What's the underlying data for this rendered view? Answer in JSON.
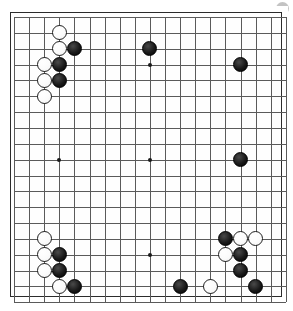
{
  "app": {
    "title": "Go Board Diagram",
    "caption": ""
  },
  "board": {
    "name": "go-board",
    "size": 19,
    "line_color": "#5a5a5a",
    "border_color": "#2b2b2b",
    "background_color": "#fefefe",
    "black_color": "#000000",
    "white_color": "#ffffff",
    "geometry": {
      "origin_x": 10,
      "origin_y": 11,
      "step_x": 15.1,
      "step_y": 15.85,
      "stone_radius": 7.6
    },
    "star_points": [
      {
        "col": 3,
        "row": 3
      },
      {
        "col": 9,
        "row": 3
      },
      {
        "col": 15,
        "row": 3
      },
      {
        "col": 3,
        "row": 9
      },
      {
        "col": 9,
        "row": 9
      },
      {
        "col": 15,
        "row": 9
      },
      {
        "col": 3,
        "row": 15
      },
      {
        "col": 9,
        "row": 15
      },
      {
        "col": 15,
        "row": 15
      }
    ],
    "stones": [
      {
        "color": "white",
        "col": 3,
        "row": 1
      },
      {
        "color": "white",
        "col": 3,
        "row": 2
      },
      {
        "color": "black",
        "col": 4,
        "row": 2
      },
      {
        "color": "black",
        "col": 9,
        "row": 2
      },
      {
        "color": "white",
        "col": 2,
        "row": 3
      },
      {
        "color": "black",
        "col": 3,
        "row": 3
      },
      {
        "color": "black",
        "col": 15,
        "row": 3
      },
      {
        "color": "white",
        "col": 2,
        "row": 4
      },
      {
        "color": "black",
        "col": 3,
        "row": 4
      },
      {
        "color": "white",
        "col": 2,
        "row": 5
      },
      {
        "color": "black",
        "col": 15,
        "row": 9
      },
      {
        "color": "white",
        "col": 2,
        "row": 14
      },
      {
        "color": "black",
        "col": 14,
        "row": 14
      },
      {
        "color": "white",
        "col": 15,
        "row": 14
      },
      {
        "color": "white",
        "col": 16,
        "row": 14
      },
      {
        "color": "white",
        "col": 2,
        "row": 15
      },
      {
        "color": "black",
        "col": 3,
        "row": 15
      },
      {
        "color": "white",
        "col": 14,
        "row": 15
      },
      {
        "color": "black",
        "col": 15,
        "row": 15
      },
      {
        "color": "white",
        "col": 2,
        "row": 16
      },
      {
        "color": "black",
        "col": 3,
        "row": 16
      },
      {
        "color": "black",
        "col": 15,
        "row": 16
      },
      {
        "color": "white",
        "col": 3,
        "row": 17
      },
      {
        "color": "black",
        "col": 4,
        "row": 17
      },
      {
        "color": "black",
        "col": 11,
        "row": 17
      },
      {
        "color": "white",
        "col": 13,
        "row": 17
      },
      {
        "color": "black",
        "col": 16,
        "row": 17
      }
    ]
  },
  "decor": {
    "corner_dot_color": "#b9b9b9"
  }
}
